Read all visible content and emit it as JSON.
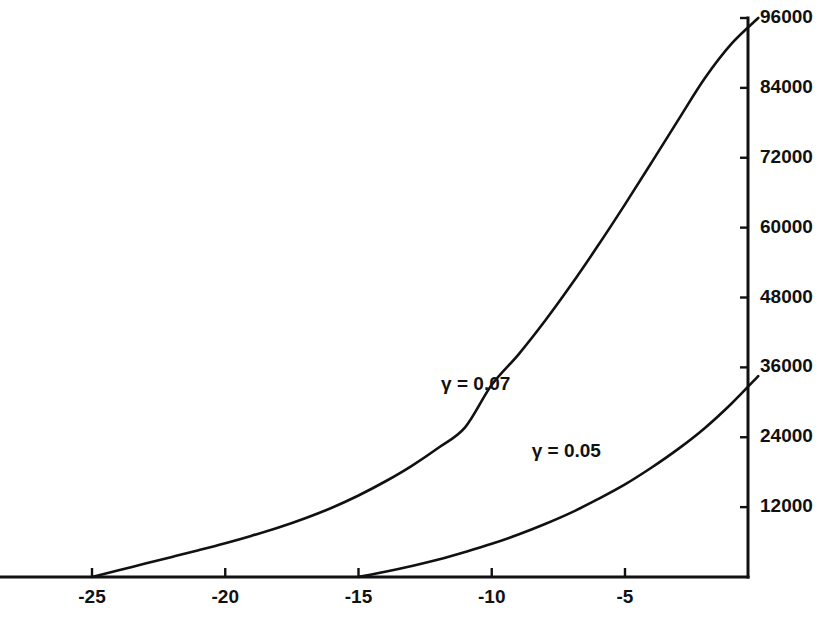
{
  "chart_data": {
    "type": "line",
    "title": "",
    "subtitle": "",
    "xlabel": "",
    "ylabel": "",
    "xlim": [
      -28.4,
      0.0
    ],
    "ylim": [
      0,
      96000
    ],
    "grid": false,
    "legend_position": "inline-annotations",
    "y_axis_side": "right",
    "x_ticks": [
      -25,
      -20,
      -15,
      -10,
      -5
    ],
    "x_tick_labels": [
      "-25",
      "-20",
      "-15",
      "-10",
      "-5"
    ],
    "y_ticks": [
      12000,
      24000,
      36000,
      48000,
      60000,
      72000,
      84000,
      96000
    ],
    "y_tick_labels": [
      "12000",
      "24000",
      "36000",
      "48000",
      "60000",
      "72000",
      "84000",
      "96000"
    ],
    "series": [
      {
        "name": "gamma-0.07",
        "label": "γ = 0.07",
        "label_x": -11.9,
        "label_y": 33000,
        "color": "#111111",
        "x": [
          -25.0,
          -24.0,
          -23.0,
          -22.0,
          -21.0,
          -20.0,
          -19.0,
          -18.0,
          -17.0,
          -16.0,
          -15.0,
          -14.0,
          -13.0,
          -12.0,
          -11.0,
          -10.0,
          -9.0,
          -8.0,
          -7.0,
          -6.0,
          -5.0,
          -4.0,
          -3.0,
          -2.0,
          -1.0,
          0.0
        ],
        "y": [
          0,
          1150,
          2300,
          3450,
          4600,
          5800,
          7100,
          8500,
          10100,
          11900,
          14000,
          16400,
          19100,
          22200,
          25700,
          33000,
          38200,
          44000,
          50300,
          57000,
          64000,
          71200,
          78500,
          85700,
          91600,
          96000
        ]
      },
      {
        "name": "gamma-0.05",
        "label": "γ = 0.05",
        "label_x": -8.5,
        "label_y": 21500,
        "color": "#111111",
        "x": [
          -15.0,
          -14.0,
          -13.0,
          -12.0,
          -11.0,
          -10.0,
          -9.0,
          -8.0,
          -7.0,
          -6.0,
          -5.0,
          -4.0,
          -3.0,
          -2.0,
          -1.0,
          0.0
        ],
        "y": [
          0,
          900,
          1900,
          3000,
          4300,
          5700,
          7300,
          9100,
          11100,
          13400,
          15900,
          18800,
          22000,
          25600,
          29800,
          34500
        ]
      }
    ]
  },
  "figure": {
    "background_color": "#ffffff",
    "foreground_color": "#111111"
  }
}
